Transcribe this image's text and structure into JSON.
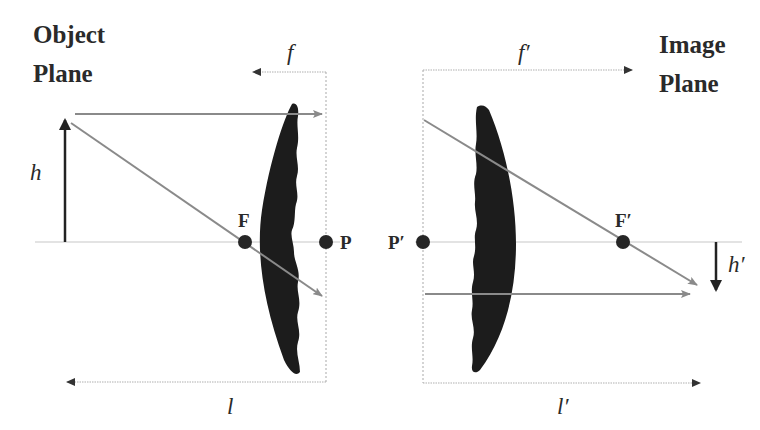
{
  "diagram": {
    "type": "thin-lens optics diagram",
    "titles": {
      "object_plane": [
        "Object",
        "Plane"
      ],
      "image_plane": [
        "Image",
        "Plane"
      ]
    },
    "points": {
      "front_focal": "F",
      "front_principal": "P",
      "rear_principal": "P′",
      "rear_focal": "F′"
    },
    "variables": {
      "object_height": "h",
      "image_height": "h′",
      "front_focal_length": "f",
      "rear_focal_length": "f′",
      "object_distance": "l",
      "image_distance": "l′"
    },
    "colors": {
      "background": "#ffffff",
      "lens": "#1c1c1c",
      "ray": "#8a8a8a",
      "axis": "#c8c8c8",
      "text": "#2a2a2a"
    }
  }
}
